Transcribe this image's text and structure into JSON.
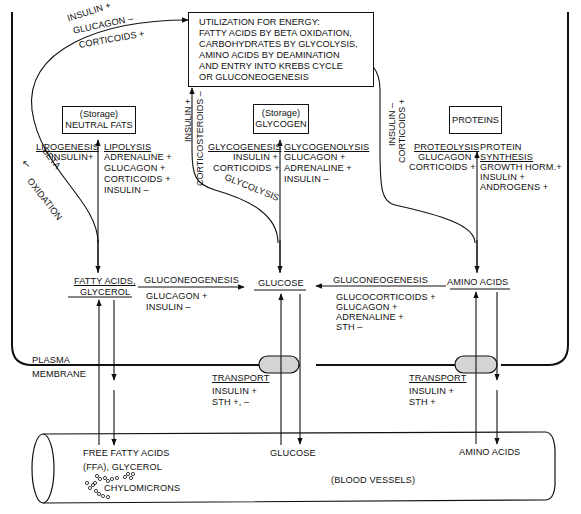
{
  "energy_box": {
    "lines": [
      "UTILIZATION FOR ENERGY:",
      "FATTY ACIDS BY BETA OXIDATION,",
      "CARBOHYDRATES BY GLYCOLYSIS,",
      "AMINO ACIDS BY DEAMINATION",
      "AND ENTRY INTO KREBS CYCLE",
      "OR GLUCONEOGENESIS"
    ]
  },
  "fats_to_energy": {
    "regulators": [
      "INSULIN +",
      "GLUCAGON –",
      "CORTICOIDS +"
    ],
    "path_label_1": "BETA",
    "path_label_2": "OXIDATION"
  },
  "neutral_fats": {
    "storage": "(Storage)",
    "name": "NEUTRAL FATS",
    "lipogenesis": "LIPOGENESIS",
    "lipogenesis_regs": [
      "INSULIN+"
    ],
    "lipolysis": "LIPOLYSIS",
    "lipolysis_regs": [
      "ADRENALINE +",
      "GLUCAGON +",
      "CORTICOIDS +",
      "INSULIN –"
    ]
  },
  "glucose_to_energy": {
    "regulators": [
      "INSULIN +",
      "CORTICOSTEROIDS –"
    ],
    "path_label": "GLYCOLYSIS"
  },
  "glycogen": {
    "storage": "(Storage)",
    "name": "GLYCOGEN",
    "glycogenesis": "GLYCOGENESIS",
    "glycogenesis_regs": [
      "INSULIN +",
      "CORTICOIDS +"
    ],
    "glycogenolysis": "GLYCOGENOLYSIS",
    "glycogenolysis_regs": [
      "GLUCAGON +",
      "ADRENALINE +",
      "INSULIN –"
    ]
  },
  "proteins_to_energy": {
    "regulators": [
      "INSULIN –",
      "CORTICOIDS +"
    ]
  },
  "proteins": {
    "name": "PROTEINS",
    "proteolysis": "PROTEOLYSIS",
    "proteolysis_regs": [
      "GLUCAGON +",
      "CORTICOIDS +"
    ],
    "synthesis_1": "PROTEIN",
    "synthesis_2": "SYNTHESIS",
    "synthesis_regs": [
      "GROWTH HORM.+",
      "INSULIN +",
      "ANDROGENS +"
    ]
  },
  "metabolites": {
    "fatty_acids_1": "FATTY ACIDS,",
    "fatty_acids_2": "GLYCEROL",
    "glucose": "GLUCOSE",
    "amino_acids": "AMINO ACIDS"
  },
  "gluconeogenesis_fat": {
    "label": "GLUCONEOGENESIS",
    "regs": [
      "GLUCAGON +",
      "INSULIN –"
    ]
  },
  "gluconeogenesis_aa": {
    "label": "GLUCONEOGENESIS",
    "regs": [
      "GLUCOCORTICOIDS +",
      "GLUCAGON +",
      "ADRENALINE +",
      "STH –"
    ]
  },
  "membrane": {
    "label_1": "PLASMA",
    "label_2": "MEMBRANE"
  },
  "transport_glucose": {
    "label": "TRANSPORT",
    "regs": [
      "INSULIN +",
      "STH +, –"
    ]
  },
  "transport_aa": {
    "label": "TRANSPORT",
    "regs": [
      "INSULIN +",
      "STH +"
    ]
  },
  "blood": {
    "ffa_1": "FREE FATTY ACIDS",
    "ffa_2": "(FFA), GLYCEROL",
    "chylomicrons": "CHYLOMICRONS",
    "glucose": "GLUCOSE",
    "amino_acids": "AMINO ACIDS",
    "vessel_label": "(BLOOD VESSELS)"
  },
  "colors": {
    "ink": "#111111",
    "transporter_fill": "#d4d4d4",
    "background": "#ffffff"
  }
}
